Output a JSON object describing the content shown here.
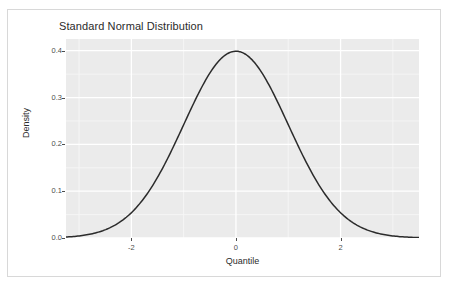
{
  "figure": {
    "width": 449,
    "height": 295,
    "background_color": "#ffffff",
    "frame_border_color": "#d8d8d8"
  },
  "chart_data": {
    "type": "line",
    "title": "Standard Normal Distribution",
    "xlabel": "Quantile",
    "ylabel": "Density",
    "xlim": [
      -3.25,
      3.5
    ],
    "ylim": [
      0.0,
      0.425
    ],
    "x_ticks": [
      -2,
      0,
      2
    ],
    "x_tick_labels": [
      "-2",
      "0",
      "2"
    ],
    "y_ticks": [
      0.0,
      0.1,
      0.2,
      0.3,
      0.4
    ],
    "y_tick_labels": [
      "0.0",
      "0.1",
      "0.2",
      "0.3",
      "0.4"
    ],
    "x_minor_ticks": [
      -3,
      -1,
      1,
      3
    ],
    "y_minor_ticks": [
      0.05,
      0.15,
      0.25,
      0.35
    ],
    "grid": true,
    "legend": null,
    "panel_background": "#ebebeb",
    "gridline_major_color": "#ffffff",
    "gridline_minor_color": "#f7f7f7",
    "line_color": "#2b2b2b",
    "line_width": 1.5,
    "series": [
      {
        "name": "Standard Normal Density",
        "distribution": "normal",
        "mean": 0,
        "sd": 1,
        "x": [
          -3.25,
          -3.0,
          -2.75,
          -2.5,
          -2.25,
          -2.0,
          -1.75,
          -1.5,
          -1.25,
          -1.0,
          -0.75,
          -0.5,
          -0.25,
          0.0,
          0.25,
          0.5,
          0.75,
          1.0,
          1.25,
          1.5,
          1.75,
          2.0,
          2.25,
          2.5,
          2.75,
          3.0,
          3.25,
          3.5
        ],
        "values": [
          0.002,
          0.004,
          0.009,
          0.018,
          0.032,
          0.054,
          0.086,
          0.13,
          0.183,
          0.242,
          0.301,
          0.352,
          0.387,
          0.399,
          0.387,
          0.352,
          0.301,
          0.242,
          0.183,
          0.13,
          0.086,
          0.054,
          0.032,
          0.018,
          0.009,
          0.004,
          0.002,
          0.001
        ]
      }
    ],
    "peak": {
      "x": 0,
      "y": 0.399
    }
  }
}
